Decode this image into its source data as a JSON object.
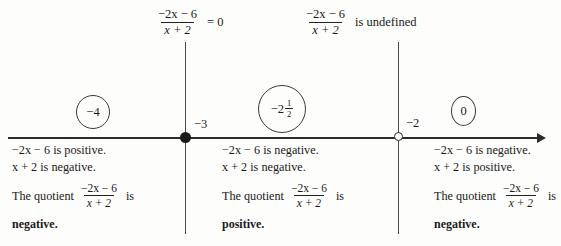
{
  "diagram": {
    "type": "sign-chart-number-line",
    "expression": {
      "numerator": "−2x − 6",
      "denominator": "x + 2"
    },
    "headers": [
      {
        "id": "zero-header",
        "numerator": "−2x − 6",
        "denominator": "x + 2",
        "tail": "= 0",
        "at_value": "−3"
      },
      {
        "id": "undefined-header",
        "numerator": "−2x − 6",
        "denominator": "x + 2",
        "tail": "is undefined",
        "at_value": "−2"
      }
    ],
    "number_line": {
      "points": [
        {
          "label": "−3",
          "marker": "closed-dot"
        },
        {
          "label": "−2",
          "marker": "open-circle"
        }
      ],
      "arrow_right": true
    },
    "test_values": [
      {
        "id": "left",
        "display": "−4"
      },
      {
        "id": "middle",
        "display": "−2",
        "whole": "−2",
        "frac_num": "1",
        "frac_den": "2"
      },
      {
        "id": "right",
        "display": "0"
      }
    ],
    "intervals": [
      {
        "id": "interval-left",
        "numerator_sign_text": "−2x − 6 is positive.",
        "denominator_sign_text": "x + 2 is negative.",
        "quotient_lead": "The quotient",
        "quotient_numerator": "−2x − 6",
        "quotient_denominator": "x + 2",
        "quotient_is": "is",
        "conclusion": "negative."
      },
      {
        "id": "interval-middle",
        "numerator_sign_text": "−2x − 6 is negative.",
        "denominator_sign_text": "x + 2 is negative.",
        "quotient_lead": "The quotient",
        "quotient_numerator": "−2x − 6",
        "quotient_denominator": "x + 2",
        "quotient_is": "is",
        "conclusion": "positive."
      },
      {
        "id": "interval-right",
        "numerator_sign_text": "−2x − 6 is negative.",
        "denominator_sign_text": "x + 2 is positive.",
        "quotient_lead": "The quotient",
        "quotient_numerator": "−2x − 6",
        "quotient_denominator": "x + 2",
        "quotient_is": "is",
        "conclusion": "negative."
      }
    ],
    "colors": {
      "background": "#fdfdfb",
      "ink": "#1a1a1a",
      "rule": "#4a4a4a"
    }
  }
}
